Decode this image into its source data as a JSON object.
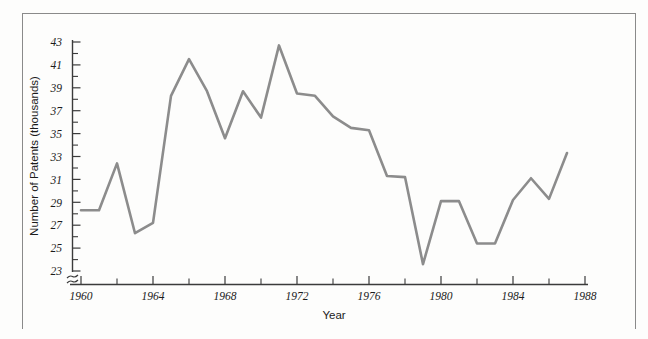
{
  "chart_data": {
    "type": "line",
    "title": "",
    "xlabel": "Year",
    "ylabel": "Number of Patents (thousands)",
    "xlim": [
      1960,
      1988
    ],
    "ylim": [
      23,
      43
    ],
    "grid": false,
    "legend": false,
    "axis_break_y": true,
    "line_color": "#8c8c8c",
    "axis_color": "#3b3b3b",
    "x_tick_labels": [
      "1960",
      "1964",
      "1968",
      "1972",
      "1976",
      "1980",
      "1984",
      "1988"
    ],
    "x_tick_values": [
      1960,
      1964,
      1968,
      1972,
      1976,
      1980,
      1984,
      1988
    ],
    "x_minor_tick_values": [
      1962,
      1966,
      1970,
      1974,
      1978,
      1982,
      1986
    ],
    "y_tick_labels": [
      "23",
      "25",
      "27",
      "29",
      "31",
      "33",
      "35",
      "37",
      "39",
      "41",
      "43"
    ],
    "y_tick_values": [
      23,
      25,
      27,
      29,
      31,
      33,
      35,
      37,
      39,
      41,
      43
    ],
    "y_minor_tick_values": [
      24,
      26,
      28,
      30,
      32,
      34,
      36,
      38,
      40,
      42
    ],
    "x": [
      1960,
      1961,
      1962,
      1963,
      1964,
      1965,
      1966,
      1967,
      1968,
      1969,
      1970,
      1971,
      1972,
      1973,
      1974,
      1975,
      1976,
      1977,
      1978,
      1979,
      1980,
      1981,
      1982,
      1983,
      1984,
      1985,
      1986,
      1987
    ],
    "values": [
      28.3,
      28.3,
      32.4,
      26.3,
      27.2,
      38.3,
      41.5,
      38.7,
      34.6,
      38.7,
      36.4,
      42.7,
      38.5,
      38.3,
      36.5,
      35.5,
      35.3,
      31.3,
      31.2,
      23.6,
      29.1,
      29.1,
      25.4,
      25.4,
      29.2,
      31.1,
      29.3,
      33.3
    ],
    "series": [
      {
        "name": "Number of Patents (thousands)",
        "values": [
          28.3,
          28.3,
          32.4,
          26.3,
          27.2,
          38.3,
          41.5,
          38.7,
          34.6,
          38.7,
          36.4,
          42.7,
          38.5,
          38.3,
          36.5,
          35.5,
          35.3,
          31.3,
          31.2,
          23.6,
          29.1,
          29.1,
          25.4,
          25.4,
          29.2,
          31.1,
          29.3,
          33.3
        ]
      }
    ]
  },
  "axes": {
    "x_title": "Year",
    "y_title": "Number of Patents (thousands)"
  }
}
